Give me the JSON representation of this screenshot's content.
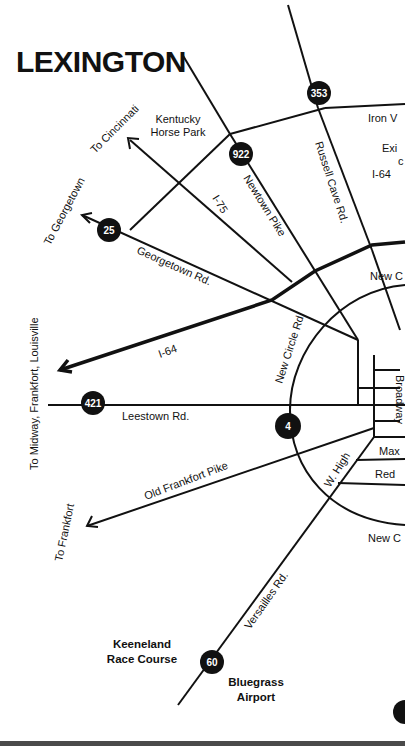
{
  "map": {
    "title": "LEXINGTON",
    "colors": {
      "ink": "#111111",
      "background": "#ffffff",
      "rule": "#4a4a4a"
    },
    "destinations": [
      {
        "id": "cincinnati",
        "label": "To Cincinnati"
      },
      {
        "id": "georgetown",
        "label": "To Georgetown"
      },
      {
        "id": "midway",
        "label": "To Midway, Frankfort, Louisville"
      },
      {
        "id": "frankfort",
        "label": "To Frankfort"
      }
    ],
    "landmarks": [
      {
        "id": "horse-park",
        "line1": "Kentucky",
        "line2": "Horse Park"
      },
      {
        "id": "keeneland",
        "line1": "Keeneland",
        "line2": "Race Course"
      },
      {
        "id": "airport",
        "line1": "Bluegrass",
        "line2": "Airport"
      }
    ],
    "roads": [
      {
        "id": "iron-works",
        "label": "Iron V"
      },
      {
        "id": "russell-cave",
        "label": "Russell Cave Rd."
      },
      {
        "id": "newtown",
        "label": "Newtown Pike"
      },
      {
        "id": "i75",
        "label": "I-75"
      },
      {
        "id": "georgetown-rd",
        "label": "Georgetown Rd."
      },
      {
        "id": "i64",
        "label": "I-64"
      },
      {
        "id": "new-circle-rd",
        "label": "New Circle Rd."
      },
      {
        "id": "leestown",
        "label": "Leestown Rd."
      },
      {
        "id": "old-frankfort",
        "label": "Old Frankfort Pike"
      },
      {
        "id": "w-high",
        "label": "W. High"
      },
      {
        "id": "versailles",
        "label": "Versailles Rd."
      },
      {
        "id": "broadway",
        "label": "Broadway"
      },
      {
        "id": "maxwell",
        "label": "Max"
      },
      {
        "id": "red",
        "label": "Red"
      },
      {
        "id": "new-circle-ne",
        "label": "New C"
      },
      {
        "id": "new-circle-se",
        "label": "New C"
      }
    ],
    "exit_note": {
      "line1": "Exi",
      "line2": "c",
      "line3": "I-64"
    },
    "shields": [
      {
        "id": "353",
        "number": "353"
      },
      {
        "id": "922",
        "number": "922"
      },
      {
        "id": "25",
        "number": "25"
      },
      {
        "id": "421",
        "number": "421"
      },
      {
        "id": "4",
        "number": "4"
      },
      {
        "id": "60",
        "number": "60"
      },
      {
        "id": "partial",
        "number": "6"
      }
    ]
  }
}
